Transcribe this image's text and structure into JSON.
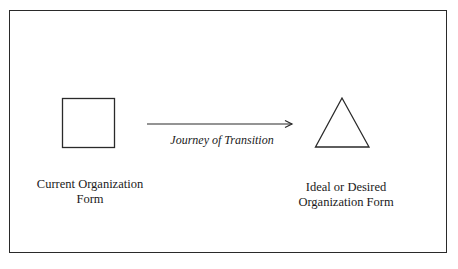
{
  "diagram": {
    "current_form": {
      "shape": "square",
      "label_line1": "Current Organization",
      "label_line2": "Form"
    },
    "transition": {
      "label": "Journey of Transition",
      "direction": "right"
    },
    "ideal_form": {
      "shape": "triangle",
      "label_line1": "Ideal or Desired",
      "label_line2": "Organization Form"
    },
    "colors": {
      "stroke": "#2a2a2a",
      "background": "#ffffff"
    }
  }
}
